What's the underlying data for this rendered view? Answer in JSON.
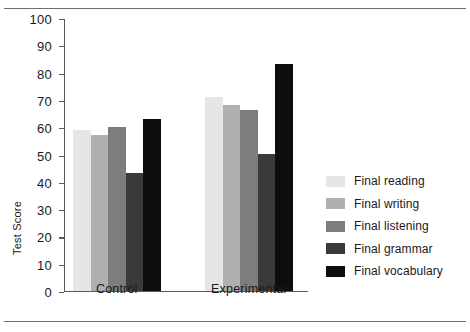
{
  "chart_data": {
    "type": "bar",
    "title": "",
    "xlabel": "",
    "ylabel": "Test Score",
    "ylim": [
      0,
      100
    ],
    "ytick_step": 10,
    "yticks": [
      100,
      90,
      80,
      70,
      60,
      50,
      40,
      30,
      20,
      10,
      0
    ],
    "grid": false,
    "legend_position": "right",
    "categories": [
      "Control",
      "Experimental"
    ],
    "series": [
      {
        "name": "Final reading",
        "values": [
          59,
          71
        ],
        "color": "#e6e6e6"
      },
      {
        "name": "Final writing",
        "values": [
          57,
          68
        ],
        "color": "#b0b0b0"
      },
      {
        "name": "Final listening",
        "values": [
          60,
          66
        ],
        "color": "#7d7d7d"
      },
      {
        "name": "Final grammar",
        "values": [
          43,
          50
        ],
        "color": "#3a3a3a"
      },
      {
        "name": "Final vocabulary",
        "values": [
          63,
          83
        ],
        "color": "#0d0d0d"
      }
    ]
  }
}
